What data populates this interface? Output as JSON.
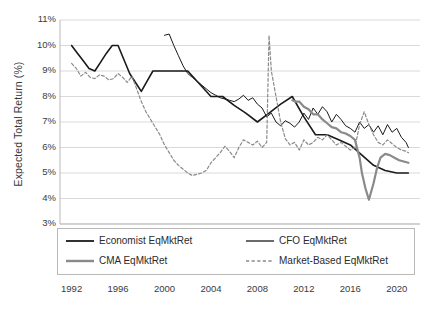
{
  "chart_data": {
    "type": "line",
    "title": "",
    "subtitle": "",
    "xlabel": "",
    "ylabel": "Expected Total Return (%)",
    "xlim": [
      1991,
      2022
    ],
    "ylim": [
      3,
      11
    ],
    "ytick_labels": [
      "11%",
      "10%",
      "9%",
      "8%",
      "7%",
      "6%",
      "5%",
      "4%",
      "3%"
    ],
    "ytick_values": [
      11,
      10,
      9,
      8,
      7,
      6,
      5,
      4,
      3
    ],
    "xtick_labels": [
      "1992",
      "1996",
      "2000",
      "2004",
      "2008",
      "2012",
      "2016",
      "2020"
    ],
    "xtick_values": [
      1992,
      1996,
      2000,
      2004,
      2008,
      2012,
      2016,
      2020
    ],
    "grid": "horizontal",
    "legend_position": "bottom",
    "series": [
      {
        "name": "Economist EqMktRet",
        "color": "#1a1a1a",
        "style": "solid",
        "width": 1.6,
        "x": [
          1992.0,
          1992.5,
          1993.0,
          1993.5,
          1994.0,
          1994.5,
          1995.0,
          1995.5,
          1996.0,
          1996.5,
          1997.0,
          1997.5,
          1998.0,
          1998.5,
          1999.0,
          1999.5,
          2000.0,
          2000.5,
          2001.0,
          2002.0,
          2003.0,
          2004.0,
          2004.5,
          2005.0,
          2006.0,
          2007.0,
          2008.0,
          2009.0,
          2010.0,
          2011.0,
          2012.0,
          2013.0,
          2014.0,
          2015.0,
          2016.0,
          2017.0,
          2018.0,
          2019.0,
          2020.0,
          2021.0
        ],
        "y": [
          10.0,
          9.7,
          9.4,
          9.1,
          9.0,
          9.35,
          9.7,
          10.0,
          10.0,
          9.45,
          8.9,
          8.55,
          8.2,
          8.6,
          9.0,
          9.0,
          9.0,
          9.0,
          9.0,
          9.0,
          8.5,
          8.0,
          8.0,
          8.0,
          7.65,
          7.35,
          7.0,
          7.35,
          7.7,
          8.0,
          7.2,
          6.5,
          6.5,
          6.3,
          6.1,
          5.7,
          5.3,
          5.1,
          5.0,
          5.0
        ]
      },
      {
        "name": "CFO EqMktRet",
        "color": "#1a1a1a",
        "style": "solid",
        "width": 1.0,
        "x": [
          2000.0,
          2000.4,
          2000.8,
          2001.2,
          2001.6,
          2002.0,
          2002.4,
          2002.8,
          2003.2,
          2003.6,
          2004.0,
          2004.4,
          2004.8,
          2005.2,
          2005.6,
          2006.0,
          2006.4,
          2006.8,
          2007.2,
          2007.6,
          2008.0,
          2008.4,
          2008.8,
          2009.2,
          2009.6,
          2010.0,
          2010.4,
          2010.8,
          2011.2,
          2011.6,
          2012.0,
          2012.4,
          2012.8,
          2013.2,
          2013.6,
          2014.0,
          2014.4,
          2014.8,
          2015.2,
          2015.6,
          2016.0,
          2016.4,
          2016.8,
          2017.2,
          2017.6,
          2018.0,
          2018.4,
          2018.8,
          2019.2,
          2019.6,
          2020.0,
          2020.4,
          2020.8,
          2021.0
        ],
        "y": [
          10.4,
          10.45,
          10.0,
          9.6,
          9.2,
          8.9,
          8.75,
          8.6,
          8.45,
          8.3,
          8.15,
          8.05,
          7.95,
          7.9,
          7.85,
          7.8,
          7.9,
          8.05,
          7.85,
          7.95,
          7.7,
          7.55,
          7.2,
          7.35,
          7.0,
          6.85,
          7.05,
          6.95,
          6.8,
          7.0,
          7.35,
          7.1,
          7.55,
          7.3,
          7.6,
          7.4,
          7.0,
          7.3,
          7.1,
          6.85,
          6.75,
          6.6,
          7.0,
          6.75,
          6.9,
          6.6,
          6.85,
          6.5,
          6.9,
          6.6,
          6.75,
          6.4,
          6.2,
          6.0
        ]
      },
      {
        "name": "CMA EqMktRet",
        "color": "#8a8a8a",
        "style": "solid",
        "width": 2.2,
        "x": [
          2011.0,
          2011.3,
          2011.6,
          2012.0,
          2012.4,
          2012.8,
          2013.2,
          2013.6,
          2014.0,
          2014.4,
          2014.8,
          2015.2,
          2015.6,
          2016.0,
          2016.4,
          2016.8,
          2017.0,
          2017.3,
          2017.6,
          2018.0,
          2018.3,
          2018.6,
          2019.0,
          2019.4,
          2019.8,
          2020.2,
          2020.6,
          2021.0
        ],
        "y": [
          7.85,
          7.8,
          7.8,
          7.6,
          7.5,
          7.3,
          7.3,
          7.1,
          6.95,
          6.8,
          6.75,
          6.6,
          6.55,
          6.45,
          6.3,
          5.6,
          5.0,
          4.4,
          3.95,
          4.6,
          5.2,
          5.6,
          5.75,
          5.7,
          5.6,
          5.5,
          5.45,
          5.4
        ]
      },
      {
        "name": "Market-Based EqMktRet",
        "color": "#8a8a8a",
        "style": "dashed",
        "width": 1.2,
        "x": [
          1992.0,
          1992.4,
          1992.8,
          1993.2,
          1993.6,
          1994.0,
          1994.4,
          1994.8,
          1995.2,
          1995.6,
          1996.0,
          1996.4,
          1996.8,
          1997.2,
          1997.6,
          1998.0,
          1998.4,
          1998.8,
          1999.2,
          1999.6,
          2000.0,
          2000.4,
          2000.8,
          2001.2,
          2001.6,
          2002.0,
          2002.4,
          2002.8,
          2003.2,
          2003.6,
          2004.0,
          2004.4,
          2004.8,
          2005.2,
          2005.6,
          2006.0,
          2006.4,
          2006.8,
          2007.2,
          2007.6,
          2008.0,
          2008.4,
          2008.8,
          2009.0,
          2009.2,
          2009.6,
          2010.0,
          2010.4,
          2010.8,
          2011.2,
          2011.6,
          2012.0,
          2012.4,
          2012.8,
          2013.2,
          2013.6,
          2014.0,
          2014.4,
          2014.8,
          2015.2,
          2015.6,
          2016.0,
          2016.4,
          2016.8,
          2017.2,
          2017.6,
          2018.0,
          2018.4,
          2018.8,
          2019.2,
          2019.6,
          2020.0,
          2020.4,
          2020.8,
          2021.0
        ],
        "y": [
          9.3,
          9.1,
          8.8,
          8.95,
          8.75,
          8.7,
          8.85,
          8.8,
          8.65,
          8.7,
          8.9,
          8.75,
          8.55,
          8.8,
          8.3,
          7.8,
          7.4,
          7.1,
          6.8,
          6.5,
          6.1,
          5.8,
          5.5,
          5.3,
          5.15,
          5.0,
          4.9,
          4.95,
          5.0,
          5.1,
          5.4,
          5.6,
          5.8,
          6.05,
          5.85,
          5.6,
          6.0,
          6.3,
          6.2,
          6.1,
          6.25,
          6.0,
          6.2,
          10.4,
          9.0,
          8.0,
          7.0,
          6.35,
          6.1,
          6.2,
          5.9,
          6.3,
          6.1,
          6.2,
          6.4,
          6.3,
          6.5,
          6.3,
          6.1,
          6.2,
          6.05,
          5.9,
          6.0,
          6.9,
          7.4,
          6.9,
          6.5,
          6.2,
          6.1,
          6.3,
          6.15,
          6.0,
          5.9,
          5.85,
          5.8
        ]
      }
    ]
  },
  "legend": {
    "items": [
      {
        "label": "Economist EqMktRet",
        "color": "#1a1a1a",
        "style": "solid",
        "width": 1.8
      },
      {
        "label": "CFO EqMktRet",
        "color": "#1a1a1a",
        "style": "solid",
        "width": 1.3
      },
      {
        "label": "CMA EqMktRet",
        "color": "#8a8a8a",
        "style": "solid",
        "width": 2.4
      },
      {
        "label": "Market-Based EqMktRet",
        "color": "#8a8a8a",
        "style": "dashed",
        "width": 1.3
      }
    ]
  },
  "axes": {
    "ylabel": "Expected Total Return (%)",
    "grid_color": "#d9d9d9",
    "axis_color": "#b9b9b9"
  }
}
